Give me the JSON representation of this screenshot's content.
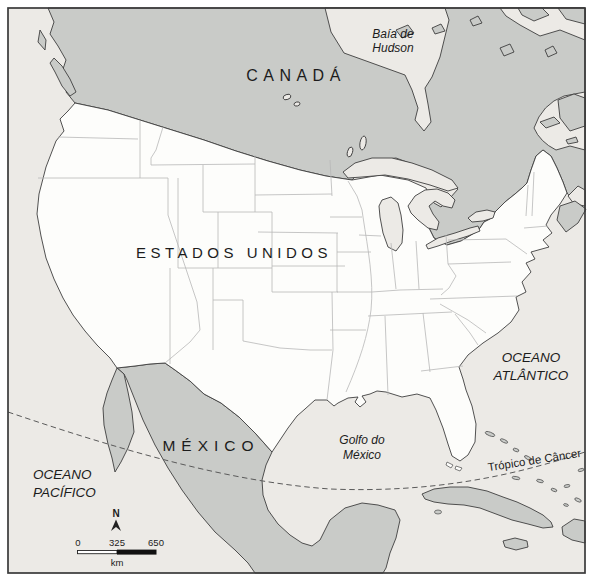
{
  "labels": {
    "canada": "CANADÁ",
    "usa": "ESTADOS UNIDOS",
    "mexico": "MÉXICO",
    "hudson_bay": {
      "line1": "Baía de",
      "line2": "Hudson"
    },
    "atlantic": {
      "line1": "OCEANO",
      "line2": "ATLÂNTICO"
    },
    "pacific": {
      "line1": "OCEANO",
      "line2": "PACÍFICO"
    },
    "gulf_mexico": {
      "line1": "Golfo do",
      "line2": "México"
    },
    "tropic": "Trópico de Câncer"
  },
  "compass": {
    "north": "N"
  },
  "scale_bar": {
    "tick0": "0",
    "tick1": "325",
    "tick2": "650",
    "unit": "km"
  },
  "colors": {
    "ocean": "#ECEAE6",
    "neighbor_land": "#C9CBC8",
    "usa_land": "#FDFDFB",
    "state_border": "#B7B7B7",
    "tropic_line": "#5A5A5A",
    "frame": "#3A3A3A",
    "text": "#1C1C1C",
    "scale_black": "#111111"
  }
}
